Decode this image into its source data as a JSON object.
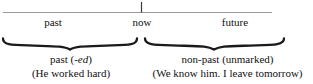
{
  "diagram": {
    "type": "timeline",
    "axis": {
      "line_color": "#9a9a9a",
      "tick_color": "#333333",
      "labels": [
        {
          "id": "past",
          "text": "past"
        },
        {
          "id": "now",
          "text": "now"
        },
        {
          "id": "future",
          "text": "future"
        }
      ],
      "tick_at": "now"
    },
    "groups": [
      {
        "id": "past-group",
        "brace": "under-brace",
        "brace_color": "#1a1a1a",
        "label_prefix": "past (",
        "label_italic": "-ed",
        "label_suffix": ")",
        "example": "(He worked hard)"
      },
      {
        "id": "non-past-group",
        "brace": "under-brace",
        "brace_color": "#1a1a1a",
        "label_prefix": "non-past (unmarked",
        "label_italic": "",
        "label_suffix": ")",
        "example": "(We know him. I leave tomorrow)"
      }
    ]
  }
}
